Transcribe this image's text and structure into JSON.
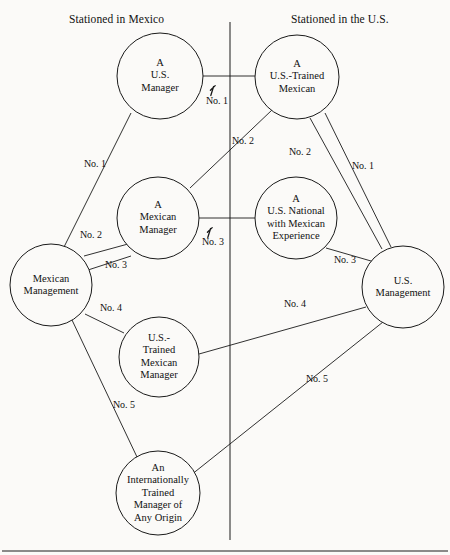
{
  "diagram": {
    "type": "node-link-diagram",
    "headers": [
      {
        "id": "left",
        "text": "Stationed in Mexico",
        "x": 69,
        "y": 13
      },
      {
        "id": "right",
        "text": "Stationed in the U.S.",
        "x": 291,
        "y": 13
      }
    ],
    "divider": {
      "x": 230,
      "y1": 22,
      "y2": 540
    },
    "bottom_rule": {
      "x1": 2,
      "x2": 448,
      "y": 551
    },
    "nodes": [
      {
        "id": "us-manager",
        "label": "A\nU.S.\nManager",
        "cx": 160,
        "cy": 76,
        "r": 43,
        "side": "mexico"
      },
      {
        "id": "us-trained-mexican",
        "label": "A\nU.S.-Trained\nMexican",
        "cx": 297,
        "cy": 77,
        "r": 42,
        "side": "us"
      },
      {
        "id": "mexican-manager",
        "label": "A\nMexican\nManager",
        "cx": 158,
        "cy": 218,
        "r": 41,
        "side": "mexico"
      },
      {
        "id": "us-national-mexican-exp",
        "label": "A\nU.S. National\nwith Mexican\nExperience",
        "cx": 296,
        "cy": 218,
        "r": 41,
        "side": "us"
      },
      {
        "id": "mexican-management",
        "label": "Mexican\nManagement",
        "cx": 51,
        "cy": 285,
        "r": 41,
        "side": "mexico"
      },
      {
        "id": "us-management",
        "label": "U.S.\nManagement",
        "cx": 403,
        "cy": 287,
        "r": 41,
        "side": "us"
      },
      {
        "id": "us-trained-mexican-mgr",
        "label": "U.S.-\nTrained\nMexican\nManager",
        "cx": 159,
        "cy": 357,
        "r": 40,
        "side": "mexico"
      },
      {
        "id": "intl-trained-manager",
        "label": "An\nInternationally\nTrained\nManager of\nAny Origin",
        "cx": 158,
        "cy": 493,
        "r": 42,
        "side": "mexico"
      }
    ],
    "edges": [
      {
        "id": "e1",
        "from": "us-manager",
        "to": "us-trained-mexican",
        "label": "No. 1",
        "lx": 217,
        "ly": 100,
        "x1": 203,
        "y1": 76,
        "x2": 255,
        "y2": 76,
        "arrow": true,
        "ax": 213,
        "ay": 88
      },
      {
        "id": "e2",
        "from": "us-manager",
        "to": "mexican-management",
        "label": "No. 1",
        "lx": 95,
        "ly": 163,
        "x1": 131,
        "y1": 113,
        "x2": 64,
        "y2": 247,
        "arrow": false
      },
      {
        "id": "e3",
        "from": "mexican-manager",
        "to": "us-trained-mexican",
        "label": "No. 2",
        "lx": 243,
        "ly": 140,
        "x1": 190,
        "y1": 188,
        "x2": 272,
        "y2": 110,
        "arrow": false
      },
      {
        "id": "e4",
        "from": "us-trained-mexican",
        "to": "us-management",
        "label": "No. 2",
        "lx": 300,
        "ly": 151,
        "x1": 310,
        "y1": 118,
        "x2": 382,
        "y2": 249,
        "arrow": false
      },
      {
        "id": "e5",
        "from": "us-trained-mexican",
        "to": "us-management",
        "label": "No. 1",
        "lx": 363,
        "ly": 165,
        "x1": 325,
        "y1": 113,
        "x2": 391,
        "y2": 247,
        "arrow": false
      },
      {
        "id": "e6",
        "from": "mexican-management",
        "to": "mexican-manager",
        "label": "No. 2",
        "lx": 91,
        "ly": 234,
        "x1": 84,
        "y1": 256,
        "x2": 128,
        "y2": 244,
        "arrow": false
      },
      {
        "id": "e7",
        "from": "mexican-management",
        "to": "mexican-manager",
        "label": "No. 3",
        "lx": 116,
        "ly": 264,
        "x1": 88,
        "y1": 270,
        "x2": 131,
        "y2": 256,
        "arrow": false
      },
      {
        "id": "e8",
        "from": "mexican-manager",
        "to": "us-national-mexican-exp",
        "label": "No. 3",
        "lx": 213,
        "ly": 241,
        "x1": 199,
        "y1": 218,
        "x2": 255,
        "y2": 218,
        "arrow": true,
        "ax": 210,
        "ay": 230
      },
      {
        "id": "e9",
        "from": "us-national-mexican-exp",
        "to": "us-management",
        "label": "No. 3",
        "lx": 345,
        "ly": 259,
        "x1": 326,
        "y1": 248,
        "x2": 378,
        "y2": 263,
        "arrow": false
      },
      {
        "id": "e10",
        "from": "mexican-management",
        "to": "us-trained-mexican-mgr",
        "label": "No. 4",
        "lx": 111,
        "ly": 307,
        "x1": 85,
        "y1": 314,
        "x2": 124,
        "y2": 333,
        "arrow": false
      },
      {
        "id": "e11",
        "from": "us-trained-mexican-mgr",
        "to": "us-management",
        "label": "No. 4",
        "lx": 295,
        "ly": 303,
        "x1": 199,
        "y1": 354,
        "x2": 366,
        "y2": 307,
        "arrow": false
      },
      {
        "id": "e12",
        "from": "mexican-management",
        "to": "intl-trained-manager",
        "label": "No. 5",
        "lx": 124,
        "ly": 404,
        "x1": 72,
        "y1": 320,
        "x2": 137,
        "y2": 457,
        "arrow": false
      },
      {
        "id": "e13",
        "from": "intl-trained-manager",
        "to": "us-management",
        "label": "No. 5",
        "lx": 317,
        "ly": 378,
        "x1": 191,
        "y1": 475,
        "x2": 383,
        "y2": 322,
        "arrow": false
      }
    ],
    "style": {
      "stroke": "#1a1a1a",
      "fill": "#fbfaf8",
      "background": "#fbfaf8",
      "text": "#111111"
    }
  }
}
